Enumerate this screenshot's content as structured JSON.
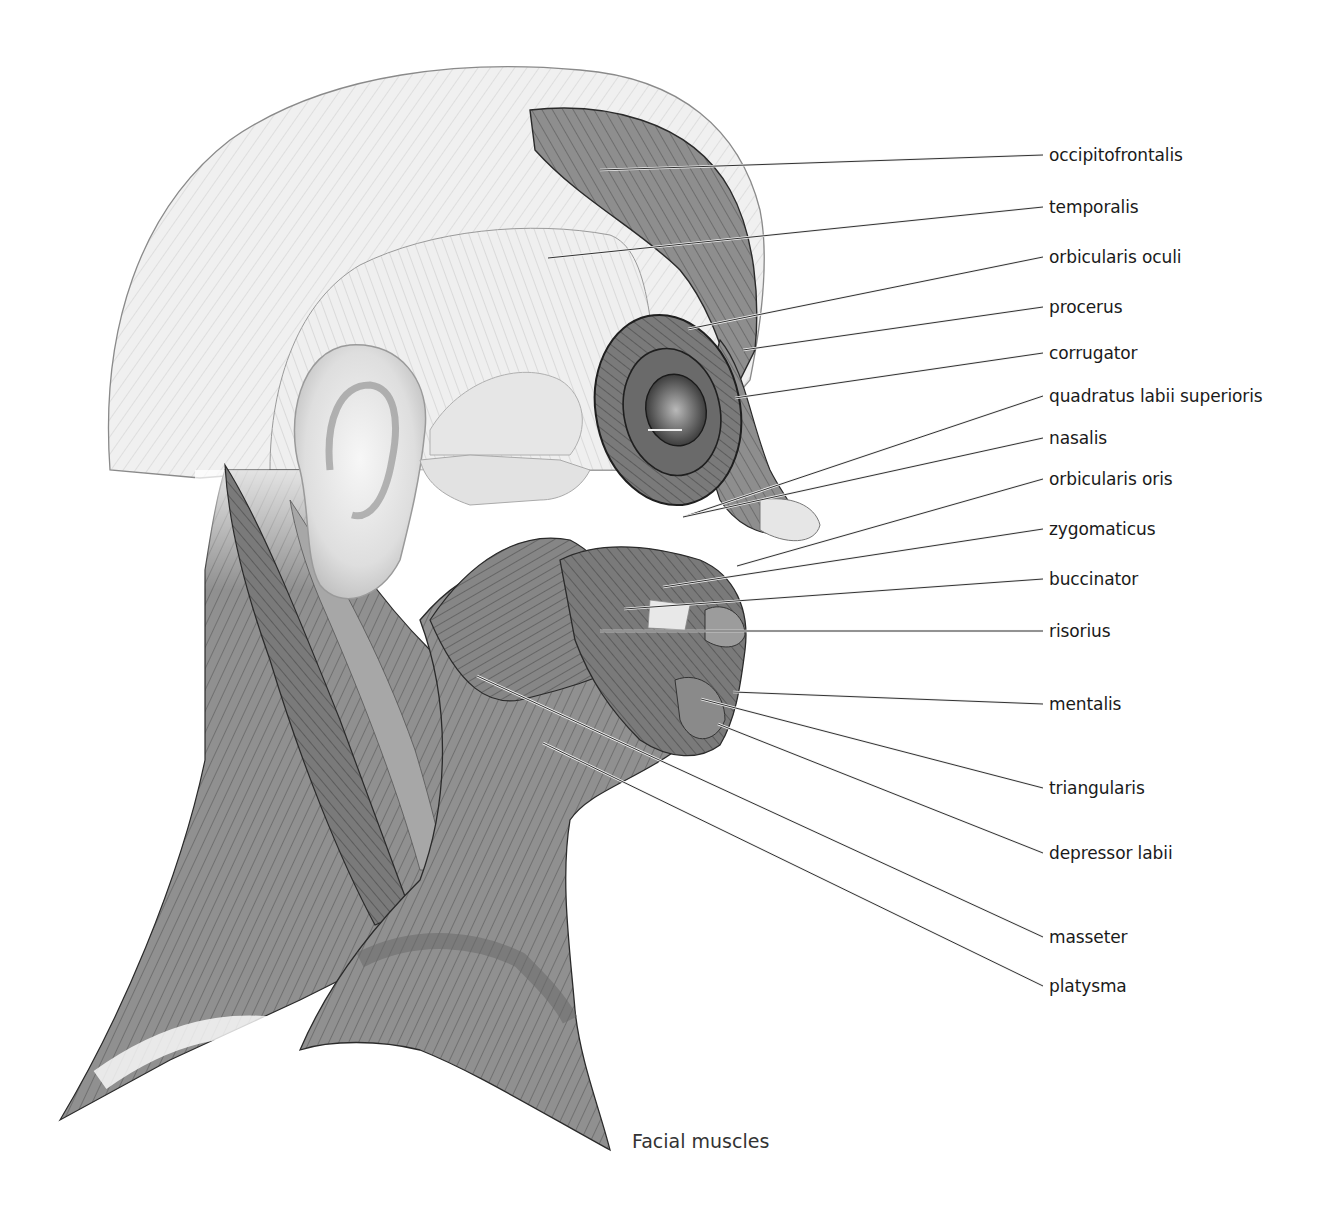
{
  "figure": {
    "caption": "Facial muscles",
    "colors": {
      "background": "#ffffff",
      "light_muscle": "#ededed",
      "mid_muscle": "#8f8f8f",
      "dark_muscle": "#6e6e6e",
      "outline": "#2a2a2a",
      "label_text": "#1a1a1a"
    }
  },
  "labels": [
    {
      "text": "occipitofrontalis",
      "y": 155,
      "anchor": [
        600,
        170
      ]
    },
    {
      "text": "temporalis",
      "y": 207,
      "anchor": [
        548,
        258
      ]
    },
    {
      "text": "orbicularis oculi",
      "y": 257,
      "anchor": [
        688,
        329
      ]
    },
    {
      "text": "procerus",
      "y": 307,
      "anchor": [
        743,
        350
      ]
    },
    {
      "text": "corrugator",
      "y": 353,
      "anchor": [
        735,
        398
      ]
    },
    {
      "text": "quadratus labii superioris",
      "y": 396,
      "anchor": [
        683,
        517
      ]
    },
    {
      "text": "nasalis",
      "y": 438,
      "anchor": [
        683,
        517
      ]
    },
    {
      "text": "orbicularis oris",
      "y": 479,
      "anchor": [
        737,
        566
      ]
    },
    {
      "text": "zygomaticus",
      "y": 529,
      "anchor": [
        663,
        587
      ]
    },
    {
      "text": "buccinator",
      "y": 579,
      "anchor": [
        624,
        609
      ]
    },
    {
      "text": "risorius",
      "y": 631,
      "anchor": [
        600,
        631
      ]
    },
    {
      "text": "mentalis",
      "y": 704,
      "anchor": [
        733,
        692
      ]
    },
    {
      "text": "triangularis",
      "y": 788,
      "anchor": [
        701,
        699
      ]
    },
    {
      "text": "depressor labii",
      "y": 853,
      "anchor": [
        718,
        724
      ]
    },
    {
      "text": "masseter",
      "y": 937,
      "anchor": [
        477,
        676
      ]
    },
    {
      "text": "platysma",
      "y": 986,
      "anchor": [
        543,
        743
      ]
    }
  ]
}
